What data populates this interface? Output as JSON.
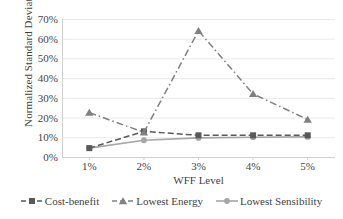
{
  "chart_data": {
    "type": "line",
    "title": "",
    "xlabel": "WFF Level",
    "ylabel": "Normalized Standard Deviation",
    "categories": [
      "1%",
      "2%",
      "3%",
      "4%",
      "5%"
    ],
    "x_tick_labels": [
      "1%",
      "2%",
      "3%",
      "4%",
      "5%"
    ],
    "y_tick_labels": [
      "0%",
      "10%",
      "20%",
      "30%",
      "40%",
      "50%",
      "60%",
      "70%"
    ],
    "y_tick_values": [
      0,
      10,
      20,
      30,
      40,
      50,
      60,
      70
    ],
    "ylim": [
      0,
      70
    ],
    "grid": "horizontal",
    "legend_position": "bottom",
    "series": [
      {
        "name": "Cost-benefit",
        "values": [
          4.5,
          13,
          11,
          11,
          11
        ],
        "marker": "square",
        "line_style": "dashed",
        "color": "#595959"
      },
      {
        "name": "Lowest Energy",
        "values": [
          22.5,
          12.5,
          64,
          32,
          19
        ],
        "marker": "triangle",
        "line_style": "dash-dot",
        "color": "#808080"
      },
      {
        "name": "Lowest Sensibility",
        "values": [
          4.5,
          8.5,
          9.7,
          10,
          10.2
        ],
        "marker": "circle",
        "line_style": "solid",
        "color": "#a6a6a6"
      }
    ]
  },
  "legend": {
    "items": [
      {
        "label": "Cost-benefit"
      },
      {
        "label": "Lowest Energy"
      },
      {
        "label": "Lowest Sensibility"
      }
    ]
  },
  "colors": {
    "grid": "#e9e9e9",
    "axis": "#d0d0d0",
    "text": "#3f3f3f",
    "background": "#ffffff"
  }
}
